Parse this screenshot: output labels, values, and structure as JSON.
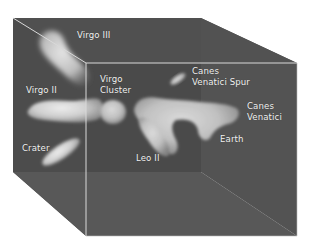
{
  "diagram": {
    "type": "3d-box-map",
    "colors": {
      "background": "#ffffff",
      "back_face": "#4a4a4a",
      "top_face": "#555555",
      "left_face": "#505050",
      "bottom_face": "#575757",
      "front_face": "#4e4e4e",
      "edge": "#d8d8d8",
      "blob": "#d6d6d6",
      "label": "#f2f2f2"
    },
    "labels": {
      "virgo_iii": {
        "lines": [
          "Virgo III"
        ]
      },
      "virgo_cluster": {
        "lines": [
          "Virgo",
          "Cluster"
        ]
      },
      "canes_venatici_spur": {
        "lines": [
          "Canes",
          "Venatici Spur"
        ]
      },
      "virgo_ii": {
        "lines": [
          "Virgo II"
        ]
      },
      "canes_venatici": {
        "lines": [
          "Canes",
          "Venatici"
        ]
      },
      "earth": {
        "lines": [
          "Earth"
        ]
      },
      "crater": {
        "lines": [
          "Crater"
        ]
      },
      "leo_ii": {
        "lines": [
          "Leo II"
        ]
      }
    }
  }
}
